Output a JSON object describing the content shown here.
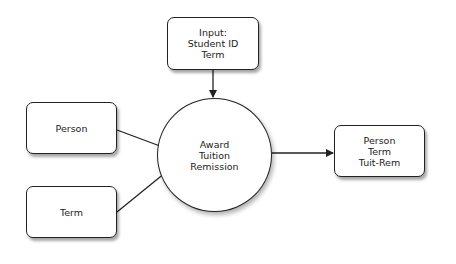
{
  "diagram": {
    "process": {
      "label": "Award\nTuition\nRemission"
    },
    "input_box": {
      "label": "Input:\nStudent ID\nTerm"
    },
    "person_box": {
      "label": "Person"
    },
    "term_box": {
      "label": "Term"
    },
    "output_box": {
      "label": "Person\nTerm\nTuit-Rem"
    },
    "colors": {
      "stroke": "#222222",
      "fill": "#ffffff"
    }
  }
}
